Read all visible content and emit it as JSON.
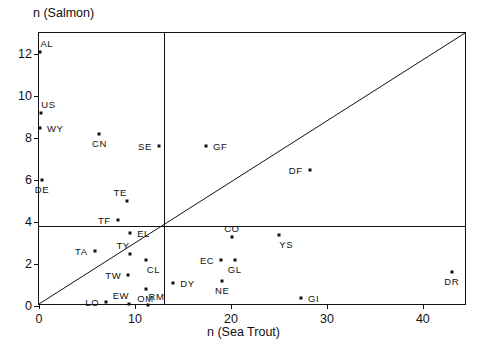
{
  "chart_data": {
    "type": "scatter",
    "title": "",
    "xlabel": "n (Sea Trout)",
    "ylabel": "n (Salmon)",
    "xlim": [
      0,
      44.6
    ],
    "ylim": [
      0,
      13.0
    ],
    "xticks": [
      0,
      10,
      20,
      30,
      40
    ],
    "xtick_labels": [
      "0",
      "10",
      "20",
      "30",
      "40"
    ],
    "yticks": [
      0,
      2,
      4,
      6,
      8,
      10,
      12
    ],
    "ytick_labels": [
      "0",
      "2",
      "4",
      "6",
      "8",
      "10",
      "12"
    ],
    "grid": false,
    "legend": null,
    "reference_lines": [
      {
        "name": "identity-diagonal",
        "type": "line",
        "from": [
          0,
          0
        ],
        "to": [
          44.6,
          13.0
        ]
      },
      {
        "name": "horizontal-divider",
        "type": "hline",
        "y": 3.8
      },
      {
        "name": "vertical-divider",
        "type": "vline",
        "x": 13.0
      }
    ],
    "points": [
      {
        "label": "AL",
        "x": 0.1,
        "y": 12.1,
        "label_pos": "above-right"
      },
      {
        "label": "US",
        "x": 0.2,
        "y": 9.2,
        "label_pos": "above-right"
      },
      {
        "label": "WY",
        "x": 0.1,
        "y": 8.5,
        "label_pos": "right"
      },
      {
        "label": "CN",
        "x": 6.3,
        "y": 8.2,
        "label_pos": "below"
      },
      {
        "label": "SE",
        "x": 12.5,
        "y": 7.6,
        "label_pos": "left"
      },
      {
        "label": "GF",
        "x": 17.4,
        "y": 7.6,
        "label_pos": "right"
      },
      {
        "label": "DE",
        "x": 0.3,
        "y": 6.0,
        "label_pos": "below"
      },
      {
        "label": "DF",
        "x": 28.2,
        "y": 6.5,
        "label_pos": "left"
      },
      {
        "label": "TE",
        "x": 9.2,
        "y": 5.0,
        "label_pos": "above-left"
      },
      {
        "label": "TF",
        "x": 8.2,
        "y": 4.1,
        "label_pos": "left"
      },
      {
        "label": "EL",
        "x": 9.5,
        "y": 3.5,
        "label_pos": "right"
      },
      {
        "label": "CO",
        "x": 20.1,
        "y": 3.3,
        "label_pos": "above"
      },
      {
        "label": "YS",
        "x": 25.0,
        "y": 3.4,
        "label_pos": "below-right"
      },
      {
        "label": "TA",
        "x": 5.8,
        "y": 2.6,
        "label_pos": "left"
      },
      {
        "label": "TY",
        "x": 9.5,
        "y": 2.5,
        "label_pos": "above-left"
      },
      {
        "label": "CL",
        "x": 11.2,
        "y": 2.2,
        "label_pos": "below-right"
      },
      {
        "label": "EC",
        "x": 19.0,
        "y": 2.2,
        "label_pos": "left"
      },
      {
        "label": "GL",
        "x": 20.4,
        "y": 2.2,
        "label_pos": "below"
      },
      {
        "label": "DR",
        "x": 43.0,
        "y": 1.6,
        "label_pos": "below"
      },
      {
        "label": "TW",
        "x": 9.3,
        "y": 1.5,
        "label_pos": "left"
      },
      {
        "label": "DY",
        "x": 14.0,
        "y": 1.1,
        "label_pos": "right"
      },
      {
        "label": "NE",
        "x": 19.1,
        "y": 1.2,
        "label_pos": "below"
      },
      {
        "label": "OM",
        "x": 11.1,
        "y": 0.8,
        "label_pos": "below"
      },
      {
        "label": "GI",
        "x": 27.3,
        "y": 0.4,
        "label_pos": "right"
      },
      {
        "label": "LO",
        "x": 7.0,
        "y": 0.2,
        "label_pos": "left"
      },
      {
        "label": "EW",
        "x": 9.4,
        "y": 0.1,
        "label_pos": "above-left"
      },
      {
        "label": "RM",
        "x": 11.4,
        "y": 0.05,
        "label_pos": "above-right"
      }
    ]
  },
  "colors": {
    "ink": "#111111",
    "background": "#ffffff"
  }
}
